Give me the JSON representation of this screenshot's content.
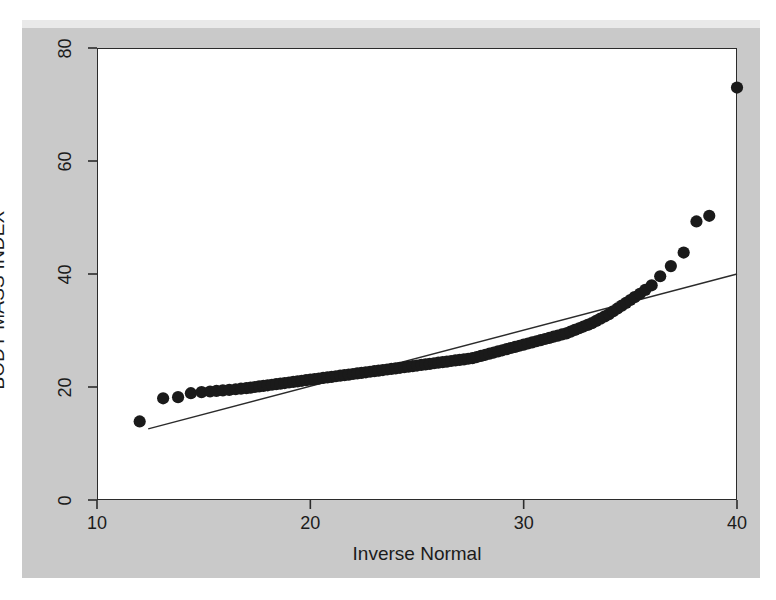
{
  "figure": {
    "background_color": "#ffffff",
    "panel_color": "#c9c9c9",
    "plot_background": "#ffffff",
    "axis_color": "#2b2b2b",
    "marker_color": "#1a1a1a",
    "line_color": "#2b2b2b"
  },
  "chart_data": {
    "type": "scatter",
    "title": "",
    "subtitle": "",
    "xlabel": "Inverse Normal",
    "ylabel": "BODY MASS INDEX",
    "xlim": [
      10,
      40
    ],
    "ylim": [
      0,
      80
    ],
    "xticks": [
      10,
      20,
      30,
      40
    ],
    "yticks": [
      0,
      20,
      40,
      60,
      80
    ],
    "xtick_labels": [
      "10",
      "20",
      "30",
      "40"
    ],
    "ytick_labels": [
      "0",
      "20",
      "40",
      "60",
      "80"
    ],
    "grid": false,
    "legend": null,
    "annotations": [],
    "series": [
      {
        "name": "BMI quantiles vs inverse normal",
        "type": "scatter",
        "marker": "filled-circle",
        "marker_size": 9,
        "color": "#1a1a1a",
        "x": [
          12.0,
          13.1,
          13.8,
          14.4,
          14.9,
          15.3,
          15.6,
          15.9,
          16.2,
          16.5,
          16.75,
          17.0,
          17.2,
          17.4,
          17.6,
          17.8,
          18.0,
          18.2,
          18.4,
          18.6,
          18.8,
          19.0,
          19.2,
          19.4,
          19.6,
          19.8,
          20.0,
          20.2,
          20.4,
          20.6,
          20.8,
          21.0,
          21.2,
          21.4,
          21.6,
          21.8,
          22.0,
          22.2,
          22.4,
          22.6,
          22.8,
          23.0,
          23.2,
          23.4,
          23.6,
          23.8,
          24.0,
          24.2,
          24.4,
          24.6,
          24.8,
          25.0,
          25.2,
          25.4,
          25.6,
          25.8,
          26.0,
          26.2,
          26.4,
          26.6,
          26.8,
          27.0,
          27.2,
          27.4,
          27.6,
          27.8,
          28.0,
          28.2,
          28.4,
          28.6,
          28.8,
          29.0,
          29.2,
          29.4,
          29.6,
          29.8,
          30.0,
          30.2,
          30.4,
          30.6,
          30.8,
          31.0,
          31.2,
          31.4,
          31.6,
          31.8,
          32.0,
          32.2,
          32.4,
          32.6,
          32.8,
          33.0,
          33.2,
          33.4,
          33.6,
          33.8,
          34.0,
          34.2,
          34.4,
          34.6,
          34.8,
          35.0,
          35.2,
          35.45,
          35.7,
          36.0,
          36.4,
          36.9,
          37.5,
          38.1,
          38.7,
          40.0
        ],
        "y": [
          13.9,
          18.0,
          18.2,
          18.9,
          19.1,
          19.2,
          19.3,
          19.4,
          19.5,
          19.6,
          19.7,
          19.8,
          19.9,
          20.0,
          20.1,
          20.2,
          20.3,
          20.4,
          20.5,
          20.6,
          20.7,
          20.8,
          20.9,
          21.0,
          21.1,
          21.2,
          21.3,
          21.4,
          21.5,
          21.6,
          21.7,
          21.8,
          21.9,
          22.0,
          22.1,
          22.2,
          22.3,
          22.4,
          22.5,
          22.6,
          22.7,
          22.8,
          22.9,
          23.0,
          23.1,
          23.2,
          23.3,
          23.4,
          23.5,
          23.6,
          23.7,
          23.8,
          23.9,
          24.0,
          24.1,
          24.2,
          24.3,
          24.4,
          24.5,
          24.6,
          24.7,
          24.8,
          24.9,
          25.0,
          25.1,
          25.3,
          25.5,
          25.7,
          25.9,
          26.1,
          26.3,
          26.5,
          26.7,
          26.9,
          27.1,
          27.3,
          27.5,
          27.7,
          27.9,
          28.1,
          28.3,
          28.5,
          28.7,
          28.9,
          29.1,
          29.3,
          29.5,
          29.8,
          30.1,
          30.4,
          30.7,
          31.0,
          31.3,
          31.7,
          32.1,
          32.5,
          32.9,
          33.4,
          33.9,
          34.4,
          34.9,
          35.4,
          35.9,
          36.5,
          37.2,
          38.0,
          39.6,
          41.4,
          43.8,
          49.3,
          50.3,
          73.0
        ]
      }
    ],
    "reference_line": {
      "name": "45-degree reference line",
      "type": "line",
      "color": "#2b2b2b",
      "width": 1.4,
      "x": [
        12.4,
        40.0
      ],
      "y": [
        12.6,
        40.0
      ]
    }
  }
}
